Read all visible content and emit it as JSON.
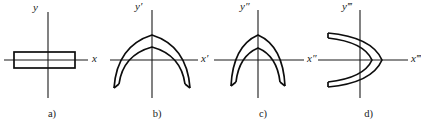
{
  "figure": {
    "width": 421,
    "height": 123,
    "background_color": "#ffffff",
    "stroke_color": "#0d0d0d",
    "axis_color": "#1a1a1a"
  },
  "panels": [
    {
      "id": "a",
      "caption": "a)",
      "y_axis_label": "y",
      "x_axis_label": "x",
      "shape_type": "rectangle",
      "shape_description": "thin horizontal rectangle centered on origin"
    },
    {
      "id": "b",
      "caption": "b)",
      "y_axis_label": "y",
      "y_axis_prime": "′",
      "x_axis_label": "x",
      "x_axis_prime": "′",
      "shape_type": "parabola-pair-down",
      "shape_description": "two nested wide downward-opening parabolas joined by vertical end caps"
    },
    {
      "id": "c",
      "caption": "c)",
      "y_axis_label": "y",
      "y_axis_prime": "″",
      "x_axis_label": "x",
      "x_axis_prime": "″",
      "shape_type": "parabola-pair-down-narrow",
      "shape_description": "two nested narrow downward-opening parabolas joined by vertical end caps"
    },
    {
      "id": "d",
      "caption": "d)",
      "y_axis_label": "y",
      "y_axis_prime": "‴",
      "x_axis_label": "x",
      "x_axis_prime": "‴",
      "shape_type": "parabola-pair-right",
      "shape_description": "two nested rightward-opening parabolas joined by end caps"
    }
  ]
}
